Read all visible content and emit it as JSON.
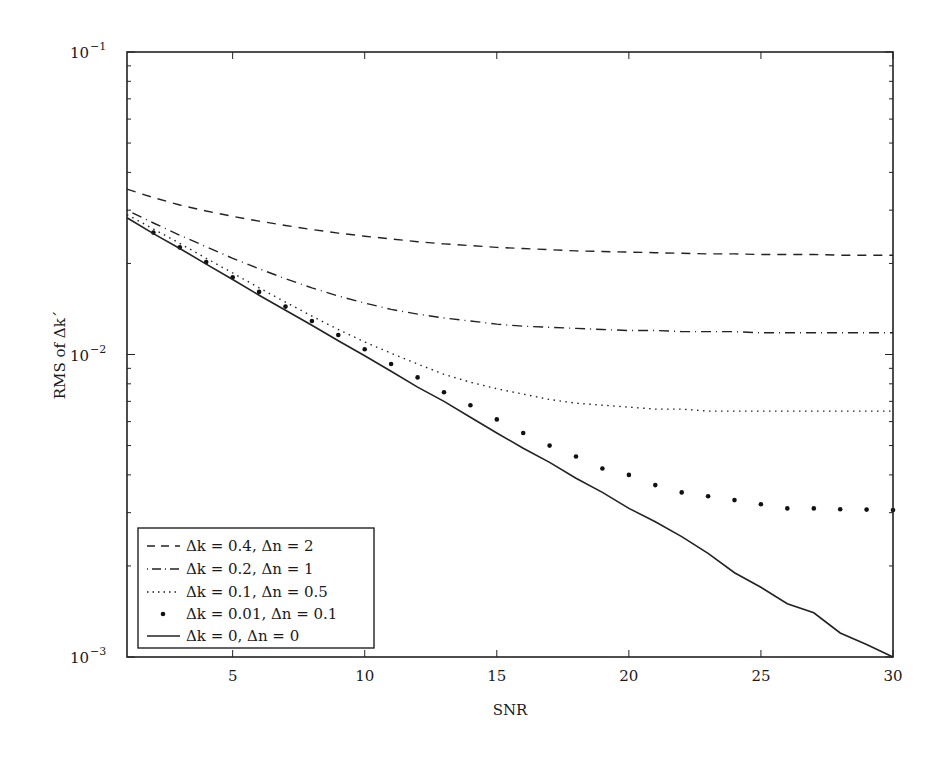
{
  "chart_data": {
    "type": "line",
    "title": "",
    "xlabel": "SNR",
    "ylabel": "RMS of Δk´",
    "xlim": [
      1,
      30
    ],
    "ylim": [
      0.001,
      0.1
    ],
    "yscale": "log",
    "grid": false,
    "legend_position": "lower left",
    "x_ticks": [
      5,
      10,
      15,
      20,
      25,
      30
    ],
    "x_tick_labels": [
      "5",
      "10",
      "15",
      "20",
      "25",
      "30"
    ],
    "y_ticks": [
      0.001,
      0.01,
      0.1
    ],
    "y_tick_labels": [
      {
        "base": "10",
        "exp": "−3"
      },
      {
        "base": "10",
        "exp": "−2"
      },
      {
        "base": "10",
        "exp": "−1"
      }
    ],
    "x": [
      1,
      2,
      3,
      4,
      5,
      6,
      7,
      8,
      9,
      10,
      11,
      12,
      13,
      14,
      15,
      16,
      17,
      18,
      19,
      20,
      21,
      22,
      23,
      24,
      25,
      26,
      27,
      28,
      29,
      30
    ],
    "series": [
      {
        "name": "Δk = 0.4, Δn = 2",
        "style": "dashed",
        "values": [
          0.0352,
          0.033,
          0.0312,
          0.0298,
          0.0286,
          0.0276,
          0.0267,
          0.0259,
          0.0252,
          0.0246,
          0.0241,
          0.0236,
          0.0232,
          0.0229,
          0.0226,
          0.0224,
          0.0222,
          0.022,
          0.0219,
          0.0218,
          0.0217,
          0.0216,
          0.0215,
          0.0215,
          0.0214,
          0.0214,
          0.0214,
          0.0213,
          0.0213,
          0.0213
        ]
      },
      {
        "name": "Δk = 0.2, Δn = 1",
        "style": "dashdot",
        "values": [
          0.03,
          0.0272,
          0.0248,
          0.0227,
          0.0208,
          0.0192,
          0.0178,
          0.0166,
          0.0156,
          0.0148,
          0.0141,
          0.0136,
          0.0132,
          0.0129,
          0.0126,
          0.0124,
          0.0123,
          0.0122,
          0.0121,
          0.012,
          0.012,
          0.0119,
          0.0119,
          0.0119,
          0.0118,
          0.0118,
          0.0118,
          0.0118,
          0.0118,
          0.0118
        ]
      },
      {
        "name": "Δk = 0.1, Δn = 0.5",
        "style": "dotted",
        "values": [
          0.029,
          0.026,
          0.0233,
          0.0208,
          0.0186,
          0.0166,
          0.0149,
          0.0134,
          0.0121,
          0.011,
          0.0101,
          0.0093,
          0.0086,
          0.0081,
          0.0077,
          0.0074,
          0.0071,
          0.0069,
          0.0068,
          0.0067,
          0.0066,
          0.0066,
          0.0065,
          0.0065,
          0.0065,
          0.0065,
          0.0065,
          0.0065,
          0.0065,
          0.0065
        ]
      },
      {
        "name": "Δk = 0.01, Δn = 0.1",
        "style": "markers",
        "values": [
          0.0283,
          0.0253,
          0.0226,
          0.0202,
          0.018,
          0.0161,
          0.0144,
          0.0129,
          0.0116,
          0.0104,
          0.0093,
          0.0084,
          0.0075,
          0.0068,
          0.0061,
          0.0055,
          0.005,
          0.0046,
          0.0042,
          0.004,
          0.0037,
          0.0035,
          0.0034,
          0.0033,
          0.0032,
          0.0031,
          0.0031,
          0.00308,
          0.00307,
          0.00306
        ]
      },
      {
        "name": "Δk = 0, Δn = 0",
        "style": "solid",
        "values": [
          0.0283,
          0.0251,
          0.0224,
          0.0199,
          0.0177,
          0.0157,
          0.014,
          0.0125,
          0.0111,
          0.0099,
          0.0088,
          0.0078,
          0.007,
          0.0062,
          0.0055,
          0.0049,
          0.0044,
          0.0039,
          0.0035,
          0.0031,
          0.0028,
          0.0025,
          0.0022,
          0.0019,
          0.0017,
          0.0015,
          0.0014,
          0.0012,
          0.0011,
          0.001
        ]
      }
    ]
  },
  "legend": {
    "items": [
      {
        "label": "Δk = 0.4, Δn = 2"
      },
      {
        "label": "Δk = 0.2, Δn = 1"
      },
      {
        "label": "Δk = 0.1, Δn = 0.5"
      },
      {
        "label": "Δk = 0.01, Δn = 0.1"
      },
      {
        "label": "Δk = 0, Δn = 0"
      }
    ]
  },
  "axes": {
    "xlabel": "SNR",
    "ylabel": "RMS of Δk´"
  }
}
